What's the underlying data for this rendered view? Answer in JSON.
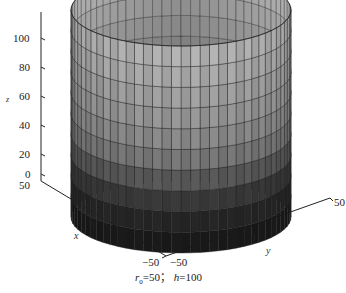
{
  "chart_data": {
    "type": "surface3d",
    "title": "",
    "xlabel": "x",
    "ylabel": "y",
    "zlabel": "z",
    "xlim": [
      -50,
      50
    ],
    "ylim": [
      -50,
      50
    ],
    "zlim": [
      0,
      110
    ],
    "x_ticks": [
      "-50",
      "0",
      "50"
    ],
    "y_ticks": [
      "-50",
      "0",
      "50"
    ],
    "z_ticks": [
      "0",
      "20",
      "40",
      "60",
      "80",
      "100"
    ],
    "radius": 50,
    "height": 100,
    "height_bands": [
      0,
      10,
      20,
      30,
      40,
      50,
      60,
      70,
      80,
      90,
      100
    ],
    "colormap": "gray",
    "grid": false,
    "caption": "r0=50; h=100"
  },
  "axes": {
    "z_label": "z",
    "x_label": "x",
    "y_label": "y",
    "z_ticks": [
      {
        "label": "100"
      },
      {
        "label": "80"
      },
      {
        "label": "60"
      },
      {
        "label": "40"
      },
      {
        "label": "20"
      },
      {
        "label": "0"
      }
    ],
    "x_ticks": [
      {
        "label": "50"
      },
      {
        "label": "0"
      },
      {
        "label": "−50"
      }
    ],
    "y_ticks": [
      {
        "label": "−50"
      },
      {
        "label": "0"
      },
      {
        "label": "50"
      }
    ]
  },
  "caption": {
    "r_symbol": "r",
    "r_sub": "0",
    "r_value": "=50； ",
    "h_symbol": "h",
    "h_value": "=100"
  }
}
